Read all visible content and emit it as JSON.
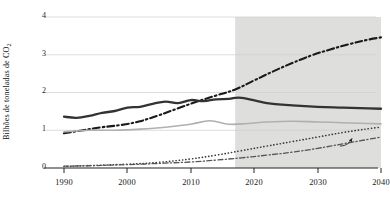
{
  "chart_data": {
    "type": "line",
    "title": "",
    "xlabel": "",
    "ylabel": "Bilhões de toneladas de CO",
    "ylabel_sub": "2",
    "xlim": [
      1990,
      2040
    ],
    "ylim": [
      0,
      4
    ],
    "yticks": [
      "0",
      "1",
      "2",
      "3",
      "4"
    ],
    "xticks": [
      "1990",
      "2000",
      "2010",
      "2020",
      "2030",
      "2040"
    ],
    "grid": "horizontal",
    "legend_position": "inline-right",
    "projection_start": 2017,
    "projection_shading_color": "#dededd",
    "annotations": [
      {
        "name": "other-low-middle-income-annotation",
        "line1": "Outros países de renda",
        "line2": "baixa e média"
      },
      {
        "name": "eu-callout",
        "text": "UE"
      }
    ],
    "series": [
      {
        "name": "Outros países de renda baixa e média",
        "style": "dash-dot",
        "color": "#1a1a1a",
        "width": 2.1,
        "label": "",
        "x": [
          1990,
          1993,
          1996,
          1999,
          2002,
          2005,
          2008,
          2011,
          2014,
          2017,
          2020,
          2023,
          2026,
          2029,
          2032,
          2035,
          2038,
          2040
        ],
        "values": [
          0.92,
          1.0,
          1.08,
          1.14,
          1.24,
          1.4,
          1.58,
          1.76,
          1.92,
          2.08,
          2.32,
          2.56,
          2.78,
          2.98,
          3.14,
          3.28,
          3.4,
          3.46
        ]
      },
      {
        "name": "Estados Unidos",
        "style": "solid",
        "color": "#333333",
        "width": 2.3,
        "label": "Estados\nUnidos",
        "label_line1": "Estados",
        "label_line2": "Unidos",
        "x": [
          1990,
          1992,
          1994,
          1996,
          1998,
          2000,
          2002,
          2004,
          2006,
          2008,
          2010,
          2012,
          2014,
          2016,
          2018,
          2022,
          2026,
          2030,
          2034,
          2038,
          2040
        ],
        "values": [
          1.36,
          1.33,
          1.38,
          1.46,
          1.51,
          1.6,
          1.62,
          1.7,
          1.76,
          1.72,
          1.8,
          1.77,
          1.82,
          1.83,
          1.86,
          1.72,
          1.66,
          1.62,
          1.6,
          1.58,
          1.57
        ]
      },
      {
        "name": "China",
        "style": "solid",
        "color": "#b0b0b0",
        "width": 1.6,
        "label": "China",
        "x": [
          1990,
          1994,
          1998,
          2002,
          2006,
          2010,
          2013,
          2016,
          2019,
          2022,
          2026,
          2030,
          2034,
          2038,
          2040
        ],
        "values": [
          0.96,
          1.0,
          1.0,
          1.03,
          1.08,
          1.16,
          1.25,
          1.16,
          1.18,
          1.22,
          1.24,
          1.22,
          1.2,
          1.18,
          1.17
        ]
      },
      {
        "name": "Índia",
        "style": "dotted",
        "color": "#3a3a3a",
        "width": 1.6,
        "label": "Índia",
        "x": [
          1990,
          1995,
          2000,
          2005,
          2010,
          2014,
          2018,
          2022,
          2026,
          2030,
          2034,
          2038,
          2040
        ],
        "values": [
          0.04,
          0.07,
          0.1,
          0.15,
          0.24,
          0.34,
          0.46,
          0.58,
          0.7,
          0.82,
          0.94,
          1.04,
          1.08
        ]
      },
      {
        "name": "UE",
        "style": "dash-dot-thin",
        "color": "#555555",
        "width": 1.3,
        "label": "UE",
        "x": [
          1990,
          1994,
          1998,
          2002,
          2006,
          2010,
          2014,
          2018,
          2022,
          2026,
          2030,
          2034,
          2038,
          2040
        ],
        "values": [
          0.05,
          0.06,
          0.08,
          0.1,
          0.13,
          0.16,
          0.21,
          0.27,
          0.34,
          0.42,
          0.52,
          0.64,
          0.76,
          0.82
        ]
      }
    ]
  }
}
